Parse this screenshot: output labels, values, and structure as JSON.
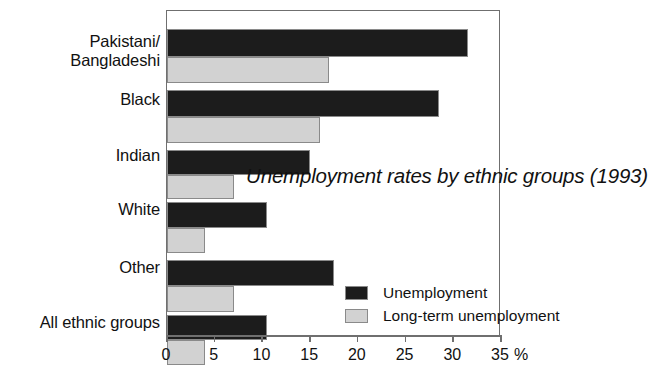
{
  "chart_data": {
    "type": "bar",
    "orientation": "horizontal",
    "title": "Unemployment rates by ethnic groups (1993)",
    "xlabel": "%",
    "ylabel": "",
    "xlim": [
      0,
      35
    ],
    "xticks": [
      0,
      5,
      10,
      15,
      20,
      25,
      30,
      35
    ],
    "xticklabels": [
      "0",
      "5",
      "10",
      "15",
      "20",
      "25",
      "30",
      "35"
    ],
    "grid": false,
    "legend_position": "inside-right",
    "categories": [
      "Pakistani/\nBangladeshi",
      "Black",
      "Indian",
      "White",
      "Other",
      "All ethnic groups"
    ],
    "series": [
      {
        "name": "Unemployment",
        "color": "#1c1c1c",
        "values": [
          31.5,
          28.5,
          15.0,
          10.5,
          17.5,
          10.5
        ]
      },
      {
        "name": "Long-term unemployment",
        "color": "#d2d2d2",
        "values": [
          17.0,
          16.0,
          7.0,
          4.0,
          7.0,
          4.0
        ]
      }
    ]
  },
  "axis": {
    "percent_symbol": "%"
  },
  "legend": {
    "items": [
      {
        "label": "Unemployment",
        "swatch": "dark"
      },
      {
        "label": "Long-term unemployment",
        "swatch": "light"
      }
    ]
  }
}
